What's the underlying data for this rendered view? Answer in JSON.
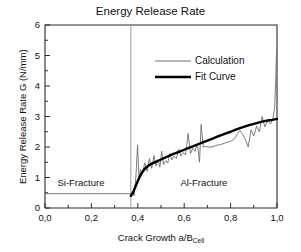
{
  "chart_data": {
    "type": "line",
    "title": "Energy Release Rate",
    "xlabel_main": "Crack Growth   a/B",
    "xlabel_sub": "Cell",
    "ylabel": "Energy Release Rate G (N/mm)",
    "xlim": [
      0.0,
      1.0
    ],
    "ylim": [
      0,
      6
    ],
    "xticks": [
      0.0,
      0.2,
      0.4,
      0.6,
      0.8,
      1.0
    ],
    "xtick_labels": [
      "0,0",
      "0,2",
      "0,4",
      "0,6",
      "0,8",
      "1,0"
    ],
    "yticks": [
      0,
      1,
      2,
      3,
      4,
      5,
      6
    ],
    "ytick_labels": [
      "0",
      "1",
      "2",
      "3",
      "4",
      "5",
      "6"
    ],
    "x_minor_step": 0.1,
    "y_minor_step": 0.5,
    "grid": false,
    "legend_position": "upper-center",
    "legend": [
      {
        "name": "Calculation",
        "style": "thin-gray-line",
        "color": "#6e6e6e"
      },
      {
        "name": "Fit Curve",
        "style": "thick-black-line",
        "color": "#000000"
      }
    ],
    "annotations": [
      {
        "text": "Si-Fracture",
        "x": 0.155,
        "y": 0.82
      },
      {
        "text": "Al-Fracture",
        "x": 0.685,
        "y": 0.82
      }
    ],
    "vertical_divider": {
      "x": 0.37,
      "color": "#9a9a9a",
      "label": "Si/Al fracture transition"
    },
    "series": [
      {
        "name": "Calculation",
        "color": "#6e6e6e",
        "width": 0.9,
        "points": [
          [
            0.0,
            0.47
          ],
          [
            0.05,
            0.47
          ],
          [
            0.1,
            0.47
          ],
          [
            0.15,
            0.47
          ],
          [
            0.2,
            0.47
          ],
          [
            0.25,
            0.47
          ],
          [
            0.3,
            0.47
          ],
          [
            0.34,
            0.47
          ],
          [
            0.368,
            0.47
          ],
          [
            0.372,
            0.36
          ],
          [
            0.378,
            0.55
          ],
          [
            0.384,
            0.4
          ],
          [
            0.392,
            1.05
          ],
          [
            0.399,
            2.07
          ],
          [
            0.405,
            1.02
          ],
          [
            0.412,
            1.26
          ],
          [
            0.42,
            1.12
          ],
          [
            0.43,
            1.48
          ],
          [
            0.44,
            1.2
          ],
          [
            0.45,
            1.62
          ],
          [
            0.46,
            1.3
          ],
          [
            0.47,
            1.72
          ],
          [
            0.478,
            1.38
          ],
          [
            0.487,
            1.58
          ],
          [
            0.495,
            1.34
          ],
          [
            0.503,
            1.86
          ],
          [
            0.511,
            1.42
          ],
          [
            0.52,
            1.55
          ],
          [
            0.529,
            1.47
          ],
          [
            0.538,
            1.78
          ],
          [
            0.547,
            1.58
          ],
          [
            0.556,
            1.7
          ],
          [
            0.566,
            1.62
          ],
          [
            0.576,
            1.92
          ],
          [
            0.586,
            1.7
          ],
          [
            0.596,
            1.82
          ],
          [
            0.606,
            1.74
          ],
          [
            0.617,
            2.44
          ],
          [
            0.627,
            1.78
          ],
          [
            0.637,
            1.96
          ],
          [
            0.647,
            1.86
          ],
          [
            0.657,
            2.12
          ],
          [
            0.666,
            1.5
          ],
          [
            0.673,
            2.74
          ],
          [
            0.682,
            2.0
          ],
          [
            0.692,
            2.02
          ],
          [
            0.703,
            2.0
          ],
          [
            0.715,
            2.0
          ],
          [
            0.728,
            2.02
          ],
          [
            0.742,
            2.06
          ],
          [
            0.757,
            2.08
          ],
          [
            0.772,
            2.12
          ],
          [
            0.788,
            2.16
          ],
          [
            0.804,
            2.2
          ],
          [
            0.818,
            2.28
          ],
          [
            0.83,
            2.44
          ],
          [
            0.84,
            2.54
          ],
          [
            0.852,
            2.42
          ],
          [
            0.864,
            2.24
          ],
          [
            0.876,
            2.0
          ],
          [
            0.888,
            2.56
          ],
          [
            0.9,
            2.36
          ],
          [
            0.912,
            2.68
          ],
          [
            0.924,
            2.5
          ],
          [
            0.936,
            3.0
          ],
          [
            0.948,
            2.66
          ],
          [
            0.96,
            2.86
          ],
          [
            0.972,
            2.76
          ],
          [
            0.982,
            2.92
          ],
          [
            0.99,
            3.3
          ],
          [
            0.995,
            4.3
          ],
          [
            0.998,
            5.15
          ]
        ]
      },
      {
        "name": "Fit Curve",
        "color": "#000000",
        "width": 2.4,
        "points": [
          [
            0.37,
            0.4
          ],
          [
            0.38,
            0.52
          ],
          [
            0.392,
            0.74
          ],
          [
            0.404,
            0.96
          ],
          [
            0.418,
            1.16
          ],
          [
            0.432,
            1.3
          ],
          [
            0.448,
            1.4
          ],
          [
            0.465,
            1.47
          ],
          [
            0.482,
            1.53
          ],
          [
            0.5,
            1.59
          ],
          [
            0.52,
            1.66
          ],
          [
            0.54,
            1.73
          ],
          [
            0.56,
            1.79
          ],
          [
            0.58,
            1.85
          ],
          [
            0.6,
            1.91
          ],
          [
            0.62,
            1.97
          ],
          [
            0.64,
            2.03
          ],
          [
            0.66,
            2.09
          ],
          [
            0.68,
            2.15
          ],
          [
            0.7,
            2.21
          ],
          [
            0.72,
            2.27
          ],
          [
            0.74,
            2.33
          ],
          [
            0.76,
            2.39
          ],
          [
            0.78,
            2.45
          ],
          [
            0.8,
            2.5
          ],
          [
            0.82,
            2.56
          ],
          [
            0.84,
            2.62
          ],
          [
            0.86,
            2.67
          ],
          [
            0.88,
            2.72
          ],
          [
            0.9,
            2.76
          ],
          [
            0.92,
            2.8
          ],
          [
            0.94,
            2.84
          ],
          [
            0.96,
            2.87
          ],
          [
            0.98,
            2.89
          ],
          [
            1.0,
            2.92
          ]
        ]
      }
    ]
  }
}
